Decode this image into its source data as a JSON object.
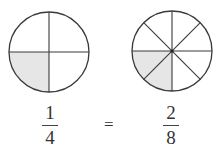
{
  "diagram": {
    "left_circle": {
      "parts": 4,
      "shaded": 1,
      "shade_color": "#e6e6e6",
      "stroke_color": "#3a3a3a"
    },
    "right_circle": {
      "parts": 8,
      "shaded": 2,
      "shade_color": "#e6e6e6",
      "stroke_color": "#3a3a3a"
    },
    "left_fraction": {
      "numerator": "1",
      "denominator": "4"
    },
    "equals": "=",
    "right_fraction": {
      "numerator": "2",
      "denominator": "8"
    }
  }
}
